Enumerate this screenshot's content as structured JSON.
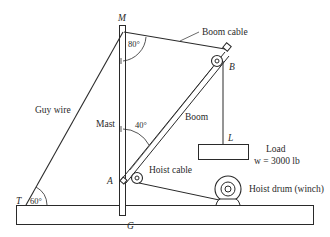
{
  "labels": {
    "mast_top": "M",
    "boom_tip": "B",
    "boom_pin": "A",
    "mast_base": "G",
    "guy_anchor": "T",
    "load_point": "L",
    "boom_cable": "Boom cable",
    "guy_wire": "Guy wire",
    "mast": "Mast",
    "boom": "Boom",
    "hoist_cable": "Hoist cable",
    "hoist_drum": "Hoist drum (winch)",
    "load_title": "Load",
    "load_weight": "w = 3000 lb"
  },
  "angles": {
    "mast_to_boom_cable": "80°",
    "mast_to_boom": "40°",
    "guy_wire_to_ground": "60°"
  },
  "colors": {
    "line": "#2a2a2a",
    "background": "#ffffff"
  }
}
